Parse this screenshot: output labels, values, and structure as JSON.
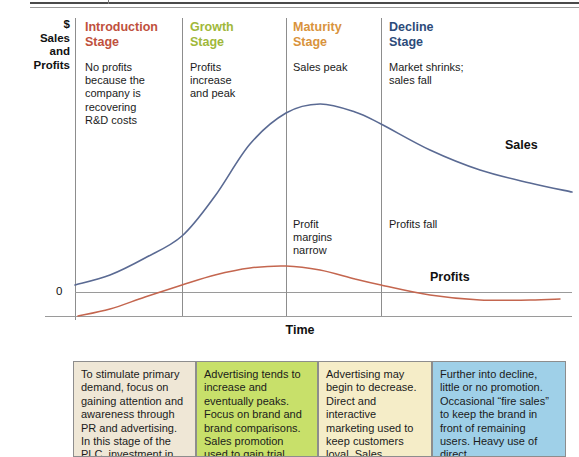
{
  "axis": {
    "y_label_lines": [
      "$",
      "Sales",
      "and",
      "Profits"
    ],
    "zero_label": "0",
    "x_label": "Time"
  },
  "stages": [
    {
      "title": "Introduction\nStage",
      "color": "#c0503d",
      "note": "No profits\nbecause the\ncompany is\nrecovering\nR&D costs",
      "mid_note": ""
    },
    {
      "title": "Growth\nStage",
      "color": "#9fb83a",
      "note": "Profits\nincrease\nand peak",
      "mid_note": ""
    },
    {
      "title": "Maturity\nStage",
      "color": "#d9933c",
      "note": "Sales peak",
      "mid_note": "Profit\nmargins\nnarrow"
    },
    {
      "title": "Decline\nStage",
      "color": "#2d4b7a",
      "note": "Market shrinks;\nsales fall",
      "mid_note": "Profits fall"
    }
  ],
  "curves": {
    "sales_label": "Sales",
    "profits_label": "Profits",
    "sales_color": "#5a6a93",
    "profits_color": "#c4664f"
  },
  "boxes": [
    {
      "bg": "#efe7d6",
      "text": "To stimulate primary demand, focus on gaining attention and awareness through PR and advertising. In this stage of the PLC, investment in"
    },
    {
      "bg": "#c8e06a",
      "text": "Advertising tends to increase and eventually peaks. Focus on brand and brand comparisons. Sales promotion used to gain trial."
    },
    {
      "bg": "#f5edc8",
      "text": "Advertising may begin to decrease. Direct and interactive marketing used to keep customers loyal. Sales promotion props up volume."
    },
    {
      "bg": "#9fd0e8",
      "text": "Further into decline, little or no promotion. Occasional “fire sales” to keep the brand in front of remaining users. Heavy use of direct"
    }
  ],
  "chart_data": {
    "type": "line",
    "xlabel": "Time",
    "ylabel": "$ Sales and Profits",
    "grid": false,
    "legend": "inline-curve-labels",
    "x_categories": [
      "Introduction Stage",
      "Growth Stage",
      "Maturity Stage",
      "Decline Stage"
    ],
    "stage_boundaries_px": [
      75,
      182,
      286,
      381,
      572
    ],
    "zero_line_y_px": 292,
    "series": [
      {
        "name": "Sales",
        "color": "#5a6a93",
        "points": [
          [
            75,
            285
          ],
          [
            110,
            275
          ],
          [
            145,
            258
          ],
          [
            182,
            236
          ],
          [
            215,
            196
          ],
          [
            250,
            144
          ],
          [
            286,
            113
          ],
          [
            320,
            104
          ],
          [
            355,
            112
          ],
          [
            381,
            124
          ],
          [
            430,
            150
          ],
          [
            480,
            170
          ],
          [
            530,
            183
          ],
          [
            572,
            192
          ]
        ]
      },
      {
        "name": "Profits",
        "color": "#c4664f",
        "points": [
          [
            78,
            316
          ],
          [
            110,
            309
          ],
          [
            145,
            297
          ],
          [
            182,
            285
          ],
          [
            215,
            275
          ],
          [
            250,
            268
          ],
          [
            286,
            266
          ],
          [
            320,
            270
          ],
          [
            355,
            279
          ],
          [
            381,
            285
          ],
          [
            430,
            295
          ],
          [
            480,
            300
          ],
          [
            530,
            300
          ],
          [
            560,
            299
          ]
        ]
      }
    ]
  }
}
